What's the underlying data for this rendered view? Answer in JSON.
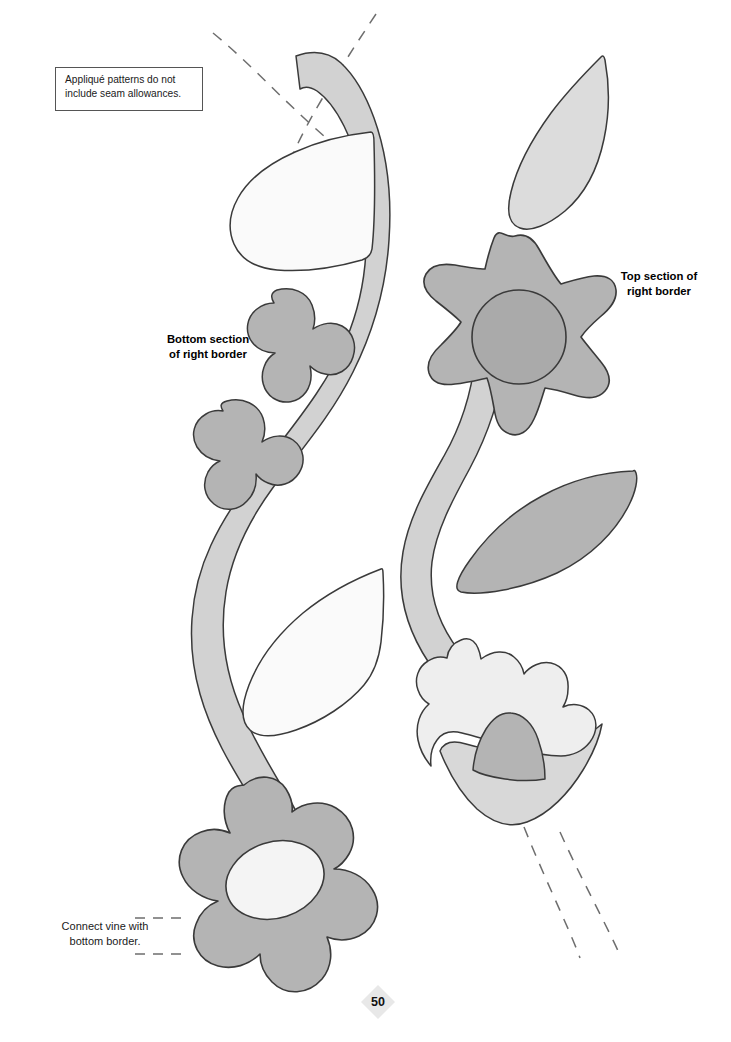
{
  "page": {
    "number": "50",
    "background_color": "#ffffff",
    "width": 731,
    "height": 1042
  },
  "note_box": {
    "line1": "Appliqué patterns do not",
    "line2": "include seam allowances.",
    "border_color": "#555555"
  },
  "captions": {
    "bottom_section": {
      "line1": "Bottom section",
      "line2": "of right border"
    },
    "top_section": {
      "line1": "Top section of",
      "line2": "right border"
    },
    "connect_vine": {
      "line1": "Connect vine with",
      "line2": "bottom border."
    }
  },
  "palette": {
    "outline": "#3a3a3a",
    "vine_gray": "#d2d2d2",
    "leaf_light": "#dcdcdc",
    "leaf_white": "#fafafa",
    "flower_mid": "#b4b4b4",
    "flower_center_dark": "#aaaaaa",
    "flower_center_light": "#f4f4f4",
    "tulip_upper": "#eeeeee",
    "tulip_inner": "#b4b4b4",
    "tulip_cup": "#d8d8d8",
    "dash_gray": "#6e6e6e",
    "page_number_diamond": "#e8e8e8"
  },
  "shapes": [
    {
      "name": "registration-dash-left",
      "kind": "dashed-guide",
      "fill": "none"
    },
    {
      "name": "registration-dash-right",
      "kind": "dashed-guide",
      "fill": "none"
    },
    {
      "name": "vine-left-stem",
      "kind": "stem",
      "fill": "#d2d2d2"
    },
    {
      "name": "vine-right-stem",
      "kind": "stem",
      "fill": "#d2d2d2"
    },
    {
      "name": "leaf-upper-left-white",
      "kind": "leaf",
      "fill": "#fafafa"
    },
    {
      "name": "leaf-lower-left-white",
      "kind": "leaf",
      "fill": "#fafafa"
    },
    {
      "name": "leaf-top-right-light",
      "kind": "leaf",
      "fill": "#dcdcdc"
    },
    {
      "name": "leaf-mid-right-gray",
      "kind": "leaf",
      "fill": "#b4b4b4"
    },
    {
      "name": "blob-clover-upper",
      "kind": "blob",
      "fill": "#b4b4b4"
    },
    {
      "name": "blob-clover-lower",
      "kind": "blob",
      "fill": "#b4b4b4"
    },
    {
      "name": "star-flower-six-point",
      "kind": "flower",
      "fill": "#b4b4b4",
      "center": "#aaaaaa"
    },
    {
      "name": "daisy-flower-seven-petal",
      "kind": "flower",
      "fill": "#b4b4b4",
      "center": "#f4f4f4"
    },
    {
      "name": "tulip-upper-blossom",
      "kind": "flower",
      "fill": "#eeeeee"
    },
    {
      "name": "tulip-inner-petal",
      "kind": "petal",
      "fill": "#b4b4b4"
    },
    {
      "name": "tulip-lower-cup",
      "kind": "petal",
      "fill": "#d8d8d8"
    },
    {
      "name": "vine-continuation-dash-a",
      "kind": "dashed-guide",
      "fill": "none"
    },
    {
      "name": "vine-continuation-dash-b",
      "kind": "dashed-guide",
      "fill": "none"
    },
    {
      "name": "connect-leader-dash-top",
      "kind": "dashed-guide",
      "fill": "none"
    },
    {
      "name": "connect-leader-dash-bot",
      "kind": "dashed-guide",
      "fill": "none"
    }
  ]
}
